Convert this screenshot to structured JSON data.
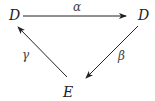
{
  "diagram": {
    "type": "commutative-triangle",
    "nodes": [
      {
        "id": "d_left",
        "label": "D"
      },
      {
        "id": "d_right",
        "label": "D"
      },
      {
        "id": "e_bottom",
        "label": "E"
      }
    ],
    "edges": [
      {
        "id": "alpha",
        "from": "d_left",
        "to": "d_right",
        "label": "α"
      },
      {
        "id": "beta",
        "from": "d_right",
        "to": "e_bottom",
        "label": "β"
      },
      {
        "id": "gamma",
        "from": "e_bottom",
        "to": "d_left",
        "label": "γ"
      }
    ]
  }
}
